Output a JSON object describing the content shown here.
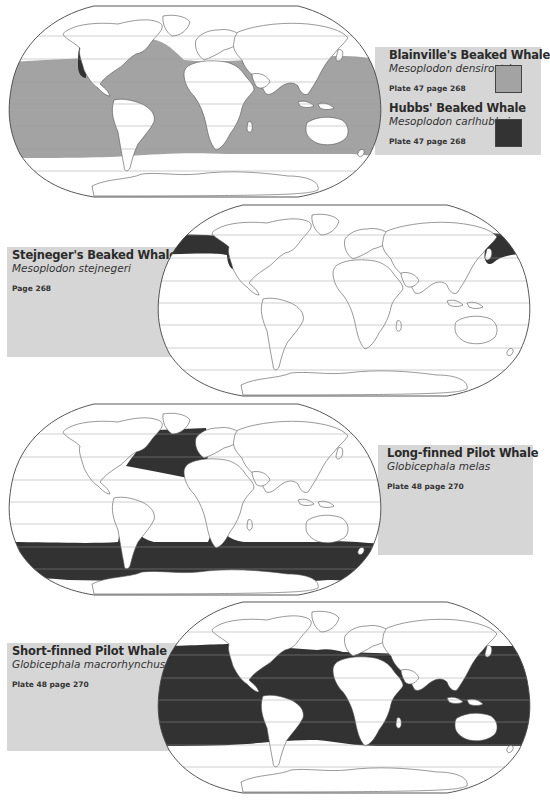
{
  "colors": {
    "panel_bg": "#d6d6d6",
    "range_light": "#a3a3a3",
    "range_dark": "#333333",
    "map_bg": "#ffffff",
    "coastline": "#555555",
    "graticule": "#9a9a9a"
  },
  "maps": [
    {
      "id": "map-1",
      "species": [
        {
          "common_name": "Blainville's Beaked Whale",
          "latin_name": "Mesoplodon densirostris",
          "reference": "Plate 47 page 268",
          "legend_color": "#a3a3a3"
        },
        {
          "common_name": "Hubbs' Beaked Whale",
          "latin_name": "Mesoplodon carlhubbsi",
          "reference": "Plate 47 page 268",
          "legend_color": "#333333"
        }
      ]
    },
    {
      "id": "map-2",
      "species": [
        {
          "common_name": "Stejneger's Beaked Whale",
          "latin_name": "Mesoplodon stejnegeri",
          "reference": "Page 268",
          "legend_color": "#333333"
        }
      ]
    },
    {
      "id": "map-3",
      "species": [
        {
          "common_name": "Long-finned Pilot Whale",
          "latin_name": "Globicephala melas",
          "reference": "Plate 48 page 270",
          "legend_color": "#333333"
        }
      ]
    },
    {
      "id": "map-4",
      "species": [
        {
          "common_name": "Short-finned Pilot Whale",
          "latin_name": "Globicephala macrorhynchus",
          "reference": "Plate 48 page 270",
          "legend_color": "#333333"
        }
      ]
    }
  ]
}
